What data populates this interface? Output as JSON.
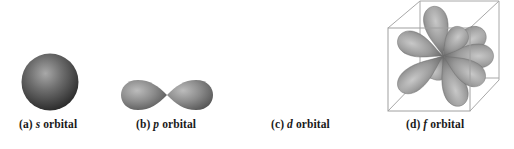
{
  "figure": {
    "panels": [
      {
        "id": "a",
        "prefix": "(a)",
        "symbol": "s",
        "suffix": "orbital",
        "shape": "sphere"
      },
      {
        "id": "b",
        "prefix": "(b)",
        "symbol": "p",
        "suffix": "orbital",
        "shape": "dumbbell, two lobes"
      },
      {
        "id": "c",
        "prefix": "(c)",
        "symbol": "d",
        "suffix": "orbital",
        "shape": "cloverleaf, four lobes"
      },
      {
        "id": "d",
        "prefix": "(d)",
        "symbol": "f",
        "suffix": "orbital",
        "shape": "eight lobes inside wireframe cube"
      }
    ],
    "colors": {
      "lobe_light": "#bdbdbd",
      "lobe_mid": "#8a8a8a",
      "lobe_dark": "#4a4a4a",
      "cube_line": "#9a9a9a",
      "label_text": "#1a1a1a"
    }
  }
}
